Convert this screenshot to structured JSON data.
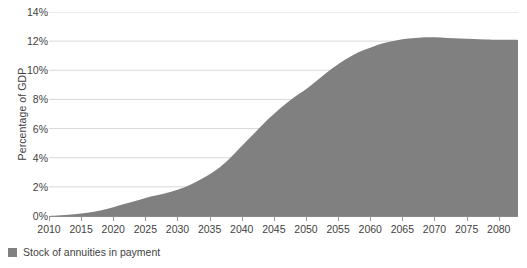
{
  "chart_data": {
    "type": "area",
    "title": "",
    "subtitle": "",
    "xlabel": "",
    "ylabel": "Percentage of GDP",
    "xlim": [
      2010,
      2083
    ],
    "ylim": [
      0,
      14
    ],
    "grid": true,
    "legend_position": "bottom-left",
    "x_tick_labels": [
      "2010",
      "2015",
      "2020",
      "2025",
      "2030",
      "2035",
      "2040",
      "2045",
      "2050",
      "2055",
      "2060",
      "2065",
      "2070",
      "2075",
      "2080"
    ],
    "x_tick_values": [
      2010,
      2015,
      2020,
      2025,
      2030,
      2035,
      2040,
      2045,
      2050,
      2055,
      2060,
      2065,
      2070,
      2075,
      2080
    ],
    "y_tick_labels": [
      "0%",
      "2%",
      "4%",
      "6%",
      "8%",
      "10%",
      "12%",
      "14%"
    ],
    "y_tick_values": [
      0,
      2,
      4,
      6,
      8,
      10,
      12,
      14
    ],
    "series": [
      {
        "name": "Stock of annuities in payment",
        "color": "#808080",
        "x": [
          2010,
          2012,
          2014,
          2016,
          2018,
          2020,
          2022,
          2024,
          2026,
          2028,
          2030,
          2032,
          2034,
          2036,
          2038,
          2040,
          2042,
          2044,
          2046,
          2048,
          2050,
          2052,
          2054,
          2056,
          2058,
          2060,
          2062,
          2064,
          2066,
          2068,
          2070,
          2072,
          2074,
          2076,
          2078,
          2080,
          2083
        ],
        "values": [
          0.0,
          0.05,
          0.12,
          0.22,
          0.38,
          0.6,
          0.85,
          1.1,
          1.35,
          1.55,
          1.8,
          2.15,
          2.6,
          3.15,
          3.9,
          4.8,
          5.7,
          6.6,
          7.4,
          8.1,
          8.7,
          9.4,
          10.1,
          10.7,
          11.2,
          11.55,
          11.85,
          12.05,
          12.18,
          12.25,
          12.26,
          12.22,
          12.18,
          12.15,
          12.12,
          12.1,
          12.08
        ]
      }
    ]
  },
  "legend": {
    "items": [
      {
        "label": "Stock of annuities in payment",
        "color": "#808080"
      }
    ]
  }
}
